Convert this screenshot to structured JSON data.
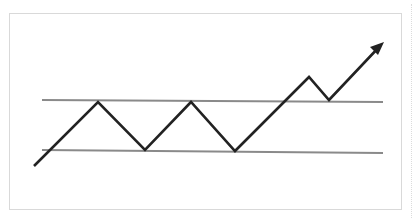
{
  "diagram": {
    "type": "rectangle-range-breakout",
    "colors": {
      "frame_border": "#d9d9d9",
      "level_line": "#8a8a8a",
      "price_path": "#222222",
      "background": "#ffffff"
    },
    "resistance_line": {
      "x1": 42,
      "y1": 100,
      "x2": 383,
      "y2": 102
    },
    "support_line": {
      "x1": 42,
      "y1": 150,
      "x2": 383,
      "y2": 153
    },
    "price_path_points": "34,166 98,102 145,150 191,102 235,151 309,77 329,100 380,46",
    "arrowhead_points": "384,42 370,47 378,55"
  }
}
